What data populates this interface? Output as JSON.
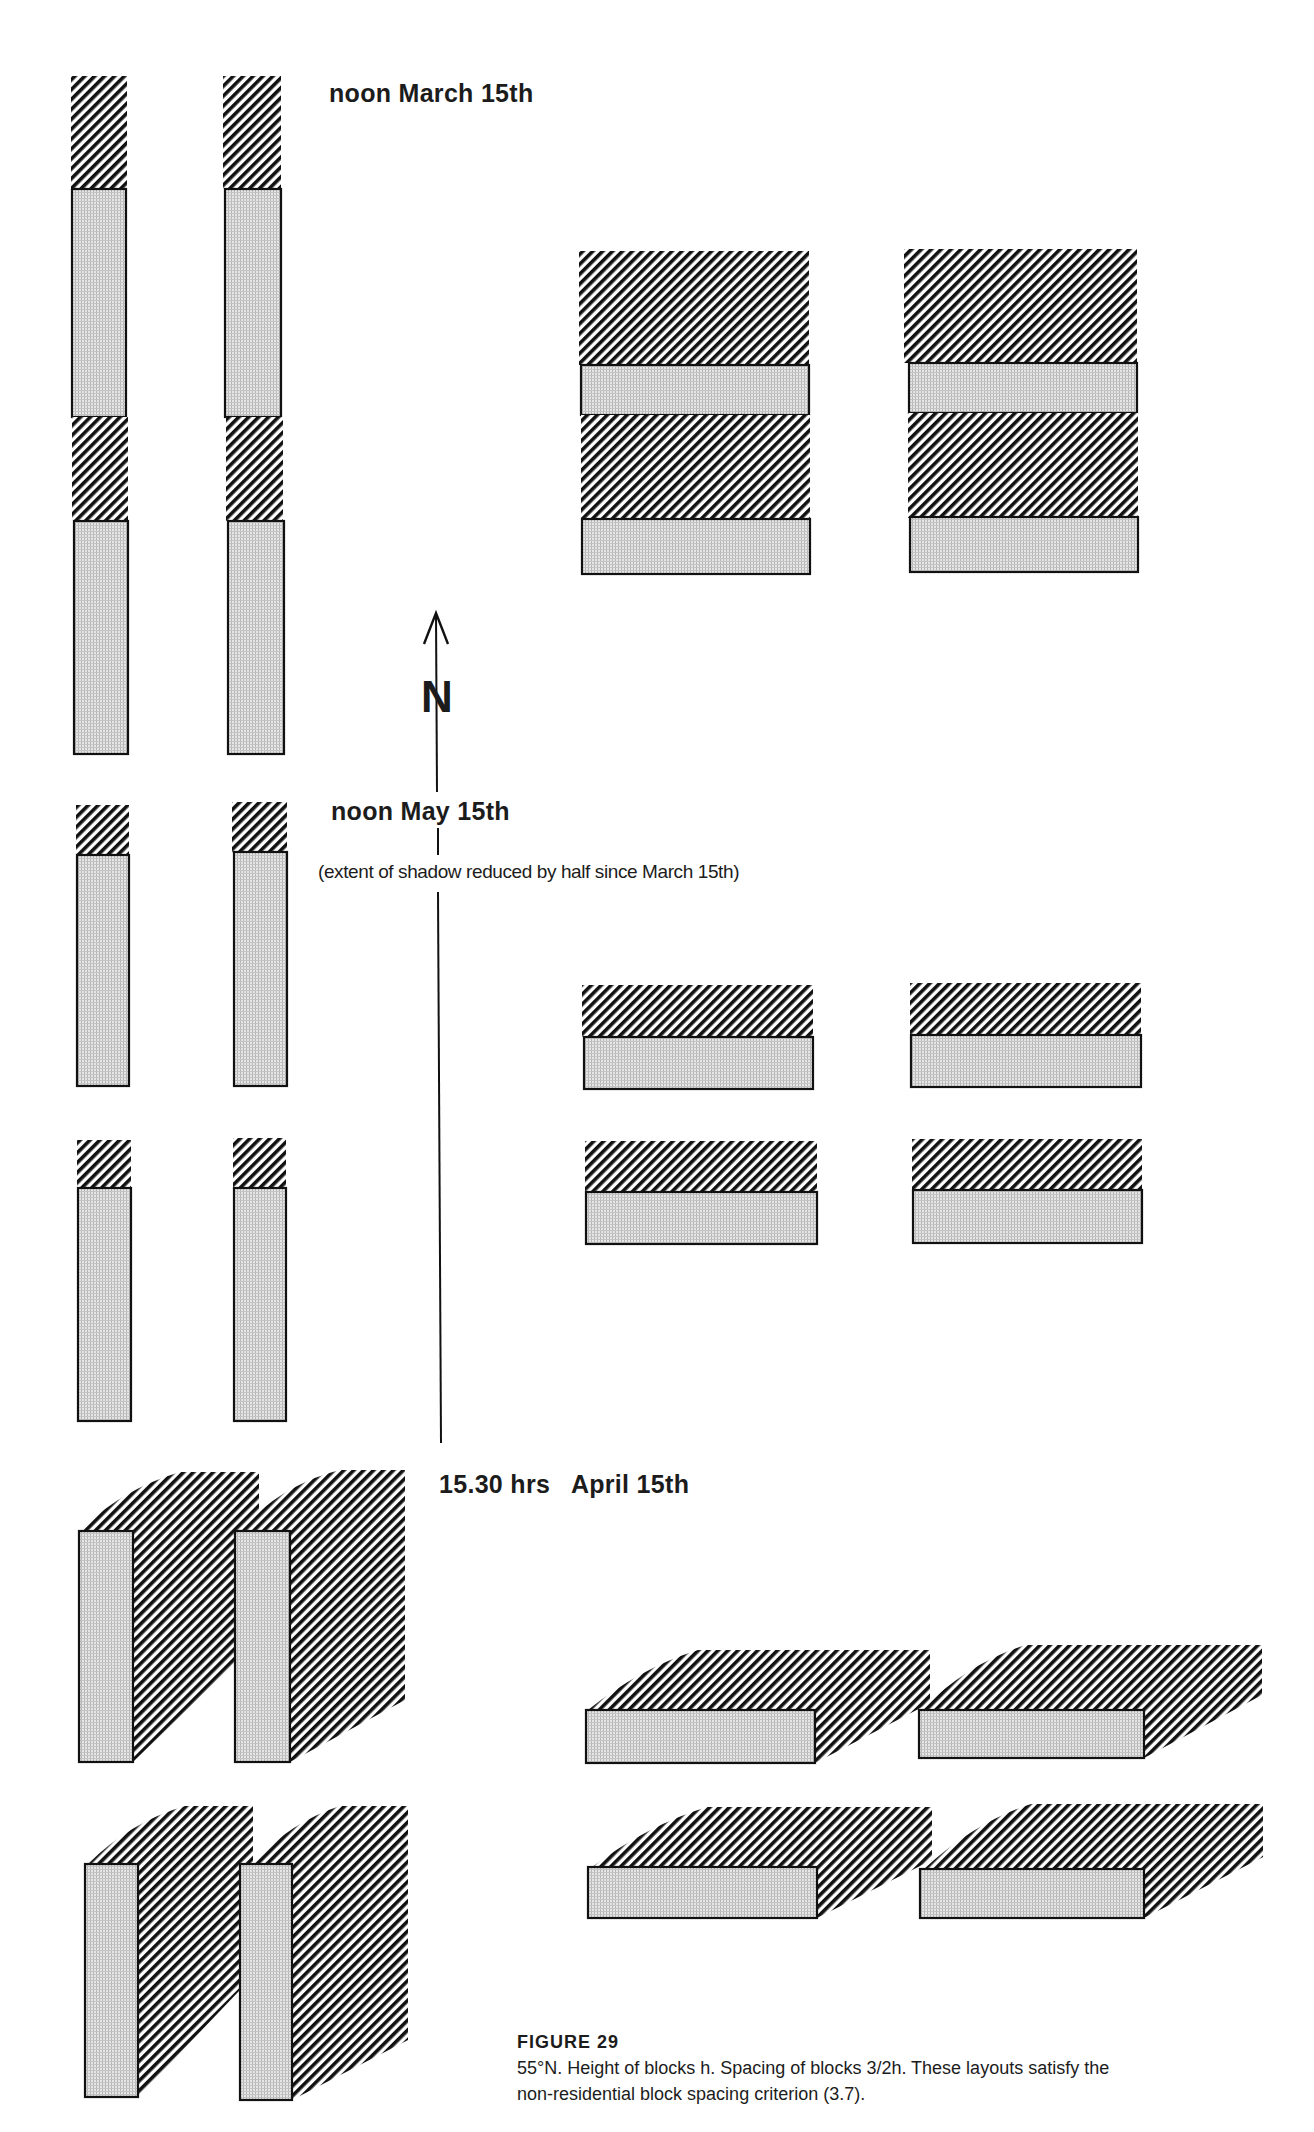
{
  "figure": {
    "labels": {
      "march": "noon March 15th",
      "may": "noon May 15th",
      "may_note": "(extent of shadow reduced by half since  March 15th)",
      "april": "15.30 hrs   April 15th",
      "north": "N"
    },
    "caption": {
      "title": "FIGURE 29",
      "line1": "55°N. Height of blocks h. Spacing of blocks 3/2h. These layouts satisfy the",
      "line2": "non-residential block spacing criterion (3.7)."
    },
    "colors": {
      "ink": "#111111",
      "block_fill": "#d9d9d9",
      "paper": "#ffffff"
    },
    "legend": {
      "hatched": "shadow",
      "dotted": "building block"
    },
    "panels": [
      {
        "id": "march",
        "time": "noon",
        "date": "March 15th",
        "shadow_ratio": 0.5
      },
      {
        "id": "may",
        "time": "noon",
        "date": "May 15th",
        "note": "extent of shadow reduced by half since March 15th"
      },
      {
        "id": "april",
        "time": "15.30 hrs",
        "date": "April 15th"
      }
    ]
  }
}
